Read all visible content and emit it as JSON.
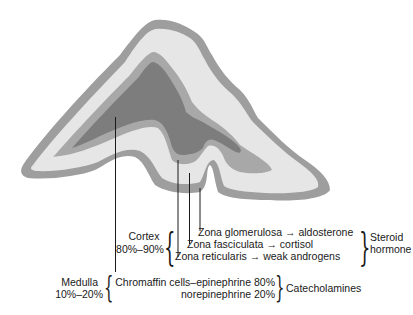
{
  "figure": {
    "colors": {
      "capsule": "#9e9e9e",
      "outer_cortex": "#e6e6e6",
      "inner_band": "#a8a8a8",
      "medulla": "#7d7d7d",
      "leader_line": "#1a1a1a"
    }
  },
  "cortex": {
    "label": "Cortex",
    "percent": "80%–90%",
    "zones": [
      {
        "name": "Zona glomerulosa",
        "arrow": "→",
        "product": "aldosterone"
      },
      {
        "name": "Zona fasciculata",
        "arrow": "→",
        "product": "cortisol"
      },
      {
        "name": "Zona reticularis",
        "arrow": "→",
        "product": "weak androgens"
      }
    ],
    "group_label_line1": "Steroid",
    "group_label_line2": "hormone"
  },
  "medulla": {
    "label": "Medulla",
    "percent": "10%–20%",
    "line1": "Chromaffin cells–epinephrine 80%",
    "line2": "norepinephrine 20%",
    "group_label": "Catecholamines"
  }
}
